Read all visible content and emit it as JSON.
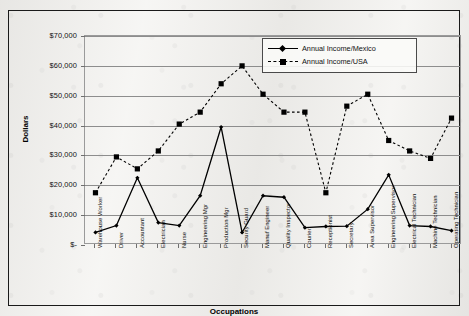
{
  "chart_data": {
    "type": "line",
    "title": "",
    "xlabel": "Occupations",
    "ylabel": "Dollars",
    "ylim": [
      0,
      70000
    ],
    "ytick_labels": [
      "$70,000",
      "$60,000",
      "$50,000",
      "$40,000",
      "$30,000",
      "$20,000",
      "$10,000",
      "$-"
    ],
    "ytick_values": [
      70000,
      60000,
      50000,
      40000,
      30000,
      20000,
      10000,
      0
    ],
    "grid": true,
    "legend_position": "top-right",
    "categories": [
      "Warehouse Worker",
      "Driver",
      "Accountant",
      "Electrician",
      "Nurse",
      "Engineering Mgr",
      "Production Mgr",
      "Security Guard",
      "Manuf Engineer",
      "Quality Inspector",
      "Courier",
      "Receptionist",
      "Secretary",
      "Area Supervisor",
      "Engineering Supervisor",
      "Electrical Technician",
      "Machine Technician",
      "Operating Technician"
    ],
    "series": [
      {
        "name": "Annual Income/Mexico",
        "style": "solid",
        "marker": "diamond",
        "color": "#000000",
        "values": [
          4200,
          6500,
          22500,
          7500,
          6500,
          16500,
          39500,
          4200,
          16500,
          16000,
          5800,
          6200,
          6300,
          12000,
          23500,
          6500,
          6200,
          4800
        ]
      },
      {
        "name": "Annual Income/USA",
        "style": "dashed",
        "marker": "square",
        "color": "#000000",
        "values": [
          17500,
          29500,
          25500,
          31500,
          40500,
          44500,
          54000,
          60000,
          50500,
          44500,
          44500,
          17500,
          46500,
          50500,
          35000,
          31500,
          29000,
          42500
        ]
      }
    ]
  },
  "legend": {
    "entries": [
      {
        "label": "Annual Income/Mexico"
      },
      {
        "label": "Annual Income/USA"
      }
    ]
  }
}
